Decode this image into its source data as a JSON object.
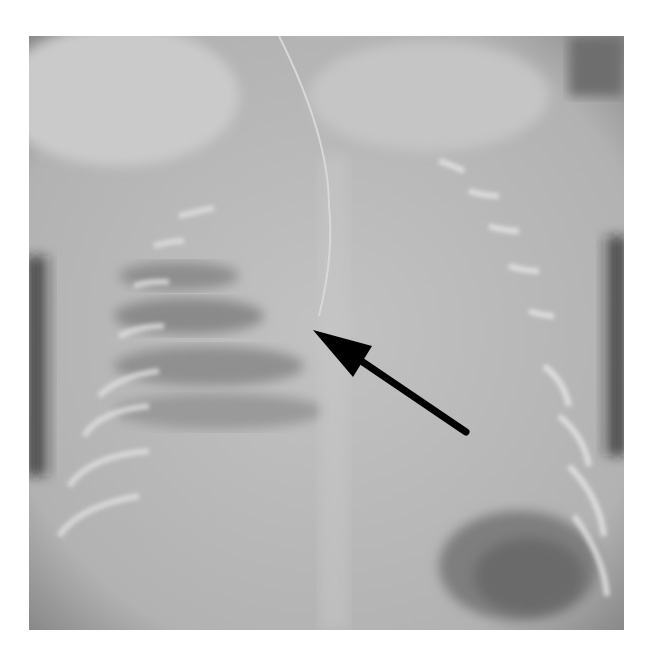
{
  "image": {
    "type": "radiograph",
    "subject": "neonatal chest and abdomen AP view",
    "frame": {
      "x": 29,
      "y": 36,
      "width": 595,
      "height": 594
    },
    "background_color": "#ffffff",
    "film_gray": "#b8b8b8"
  },
  "annotations": [
    {
      "type": "arrow",
      "icon": "arrow-icon",
      "color": "#000000",
      "tip": [
        313,
        330
      ],
      "tail": [
        466,
        432
      ]
    }
  ]
}
